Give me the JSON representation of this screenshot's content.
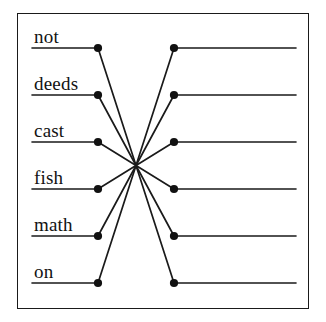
{
  "diagram": {
    "type": "matching-exercise",
    "title": "",
    "border_color": "#1a1a1a",
    "line_color": "#1a1a1a",
    "dot_color": "#111111",
    "text_color": "#121212",
    "left_items": [
      {
        "label": "not",
        "index": 1,
        "dot_x": 98,
        "dot_y": 48,
        "rule_x1": 32,
        "rule_x2": 98
      },
      {
        "label": "deeds",
        "index": 2,
        "dot_x": 98,
        "dot_y": 95,
        "rule_x1": 32,
        "rule_x2": 98
      },
      {
        "label": "cast",
        "index": 3,
        "dot_x": 98,
        "dot_y": 142,
        "rule_x1": 32,
        "rule_x2": 98
      },
      {
        "label": "fish",
        "index": 4,
        "dot_x": 98,
        "dot_y": 189,
        "rule_x1": 32,
        "rule_x2": 98
      },
      {
        "label": "math",
        "index": 5,
        "dot_x": 98,
        "dot_y": 236,
        "rule_x1": 32,
        "rule_x2": 98
      },
      {
        "label": "on",
        "index": 6,
        "dot_x": 98,
        "dot_y": 283,
        "rule_x1": 32,
        "rule_x2": 98
      }
    ],
    "right_items": [
      {
        "label": "",
        "index": 1,
        "dot_x": 174,
        "dot_y": 48,
        "rule_x1": 174,
        "rule_x2": 296
      },
      {
        "label": "",
        "index": 2,
        "dot_x": 174,
        "dot_y": 95,
        "rule_x1": 174,
        "rule_x2": 296
      },
      {
        "label": "",
        "index": 3,
        "dot_x": 174,
        "dot_y": 142,
        "rule_x1": 174,
        "rule_x2": 296
      },
      {
        "label": "",
        "index": 4,
        "dot_x": 174,
        "dot_y": 189,
        "rule_x1": 174,
        "rule_x2": 296
      },
      {
        "label": "",
        "index": 5,
        "dot_x": 174,
        "dot_y": 236,
        "rule_x1": 174,
        "rule_x2": 296
      },
      {
        "label": "",
        "index": 6,
        "dot_x": 174,
        "dot_y": 283,
        "rule_x1": 174,
        "rule_x2": 296
      }
    ],
    "connections": [
      {
        "from": "not",
        "to_index": 6,
        "x1": 98,
        "y1": 48,
        "x2": 174,
        "y2": 283
      },
      {
        "from": "deeds",
        "to_index": 5,
        "x1": 98,
        "y1": 95,
        "x2": 174,
        "y2": 236
      },
      {
        "from": "cast",
        "to_index": 4,
        "x1": 98,
        "y1": 142,
        "x2": 174,
        "y2": 189
      },
      {
        "from": "fish",
        "to_index": 3,
        "x1": 98,
        "y1": 189,
        "x2": 174,
        "y2": 142
      },
      {
        "from": "math",
        "to_index": 2,
        "x1": 98,
        "y1": 236,
        "x2": 174,
        "y2": 95
      },
      {
        "from": "on",
        "to_index": 1,
        "x1": 98,
        "y1": 283,
        "x2": 174,
        "y2": 48
      }
    ],
    "label_positions": [
      {
        "x": 34,
        "y": 27
      },
      {
        "x": 34,
        "y": 74
      },
      {
        "x": 34,
        "y": 121
      },
      {
        "x": 34,
        "y": 168
      },
      {
        "x": 34,
        "y": 215
      },
      {
        "x": 34,
        "y": 262
      }
    ]
  }
}
